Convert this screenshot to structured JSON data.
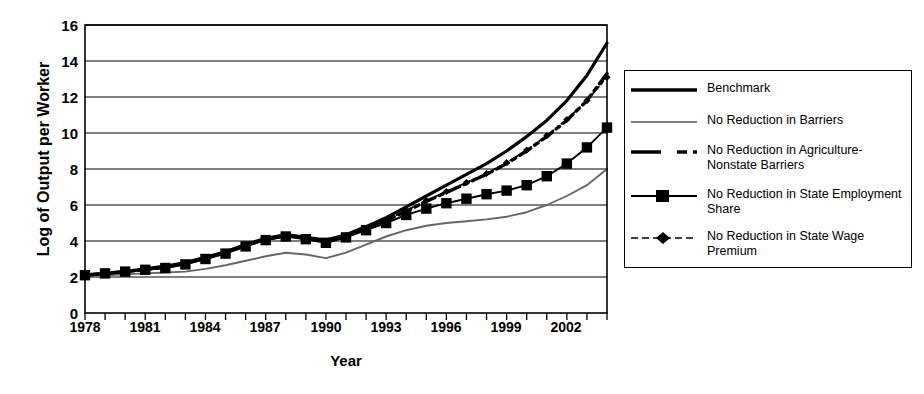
{
  "chart_data": {
    "type": "line",
    "title": "",
    "xlabel": "Year",
    "ylabel": "Log of Output per Worker",
    "xlim": [
      1978,
      2004
    ],
    "ylim": [
      0,
      16
    ],
    "yticks": [
      0,
      2,
      4,
      6,
      8,
      10,
      12,
      14,
      16
    ],
    "xticks_labeled": [
      1978,
      1981,
      1984,
      1987,
      1990,
      1993,
      1996,
      1999,
      2002
    ],
    "grid": "horizontal",
    "legend_position": "right-outside",
    "x": [
      1978,
      1979,
      1980,
      1981,
      1982,
      1983,
      1984,
      1985,
      1986,
      1987,
      1988,
      1989,
      1990,
      1991,
      1992,
      1993,
      1994,
      1995,
      1996,
      1997,
      1998,
      1999,
      2000,
      2001,
      2002,
      2003,
      2004
    ],
    "series": [
      {
        "name": "Benchmark",
        "style": "solid-thick",
        "values": [
          2.1,
          2.2,
          2.3,
          2.45,
          2.6,
          2.8,
          3.1,
          3.4,
          3.8,
          4.15,
          4.35,
          4.2,
          4.05,
          4.35,
          4.8,
          5.3,
          5.9,
          6.5,
          7.1,
          7.7,
          8.3,
          9.0,
          9.8,
          10.7,
          11.8,
          13.2,
          15.0
        ]
      },
      {
        "name": "No Reduction in Barriers",
        "style": "solid-thin-gray",
        "values": [
          2.05,
          2.1,
          2.15,
          2.2,
          2.25,
          2.3,
          2.45,
          2.65,
          2.9,
          3.15,
          3.35,
          3.25,
          3.05,
          3.35,
          3.8,
          4.25,
          4.6,
          4.85,
          5.0,
          5.1,
          5.2,
          5.35,
          5.6,
          6.0,
          6.5,
          7.1,
          8.0
        ]
      },
      {
        "name": "No Reduction in Agriculture-Nonstate Barriers",
        "style": "dashed-thick",
        "values": [
          2.1,
          2.2,
          2.3,
          2.4,
          2.55,
          2.75,
          3.05,
          3.35,
          3.75,
          4.1,
          4.3,
          4.15,
          3.95,
          4.25,
          4.7,
          5.15,
          5.65,
          6.2,
          6.7,
          7.2,
          7.7,
          8.3,
          9.0,
          9.8,
          10.7,
          11.8,
          13.3
        ]
      },
      {
        "name": "No Reduction in State Employment Share",
        "style": "solid-square-markers",
        "values": [
          2.1,
          2.2,
          2.3,
          2.4,
          2.5,
          2.7,
          3.0,
          3.3,
          3.7,
          4.05,
          4.25,
          4.1,
          3.9,
          4.2,
          4.6,
          5.0,
          5.45,
          5.8,
          6.1,
          6.35,
          6.6,
          6.8,
          7.1,
          7.6,
          8.3,
          9.2,
          10.3
        ]
      },
      {
        "name": "No Reduction in State Wage Premium",
        "style": "dotted-diamond-markers",
        "values": [
          2.1,
          2.2,
          2.3,
          2.4,
          2.55,
          2.75,
          3.05,
          3.35,
          3.75,
          4.1,
          4.3,
          4.15,
          3.95,
          4.25,
          4.7,
          5.15,
          5.7,
          6.25,
          6.75,
          7.25,
          7.75,
          8.35,
          9.05,
          9.85,
          10.75,
          11.8,
          13.1
        ]
      }
    ]
  },
  "axis": {
    "ylabel": "Log of Output per Worker",
    "xlabel": "Year",
    "yticks": [
      "16",
      "14",
      "12",
      "10",
      "8",
      "6",
      "4",
      "2",
      "0"
    ],
    "xticks": [
      "1978",
      "1981",
      "1984",
      "1987",
      "1990",
      "1993",
      "1996",
      "1999",
      "2002"
    ]
  },
  "legend": {
    "items": [
      {
        "label": "Benchmark"
      },
      {
        "label": "No Reduction in Barriers"
      },
      {
        "label": "No Reduction in Agriculture-Nonstate Barriers"
      },
      {
        "label": "No Reduction in State Employment Share"
      },
      {
        "label": "No Reduction in State Wage Premium"
      }
    ]
  },
  "colors": {
    "ink": "#000000",
    "gray_line": "#777777",
    "background": "#ffffff"
  }
}
